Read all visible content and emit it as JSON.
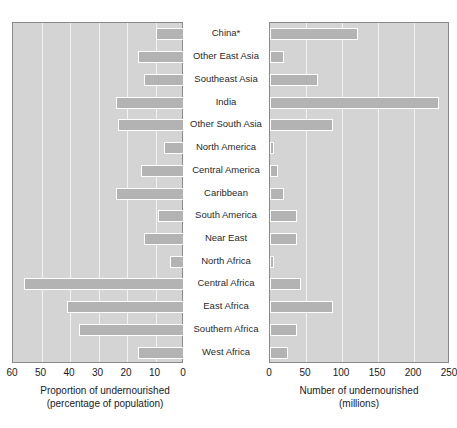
{
  "chart_data": {
    "type": "bar",
    "orientation": "horizontal",
    "layout": "two-panel butterfly / back-to-back regional bar chart",
    "categories": [
      "China*",
      "Other East Asia",
      "Southeast Asia",
      "India",
      "Other South Asia",
      "North America",
      "Central America",
      "Caribbean",
      "South America",
      "Near East",
      "North Africa",
      "Central Africa",
      "East Africa",
      "Southern Africa",
      "West Africa"
    ],
    "panels": [
      {
        "id": "left",
        "xlabel_line1": "Proportion of undernourished",
        "xlabel_line2": "(percentage of population)",
        "unit": "percent",
        "direction": "right-to-left",
        "xlim": [
          0,
          60
        ],
        "ticks": [
          60,
          50,
          40,
          30,
          20,
          10,
          0
        ],
        "grid": true,
        "values": [
          10,
          16,
          14,
          24,
          23,
          7,
          15,
          24,
          9,
          14,
          5,
          56,
          41,
          37,
          16
        ]
      },
      {
        "id": "right",
        "xlabel_line1": "Number of undernourished",
        "xlabel_line2": "(millions)",
        "unit": "millions",
        "direction": "left-to-right",
        "xlim": [
          0,
          250
        ],
        "ticks": [
          0,
          50,
          100,
          150,
          200,
          250
        ],
        "grid": true,
        "values": [
          122,
          19,
          67,
          235,
          88,
          6,
          11,
          20,
          38,
          37,
          5,
          43,
          87,
          37,
          25
        ]
      }
    ],
    "title": "",
    "legend": null,
    "colors": {
      "panel_background": "#d4d4d4",
      "bar_fill": "#b3b3b3",
      "bar_border": "#ffffff",
      "gridline": "#f2f2f2",
      "axis_border": "#8a8a8a",
      "text": "#1a1a1a"
    }
  }
}
